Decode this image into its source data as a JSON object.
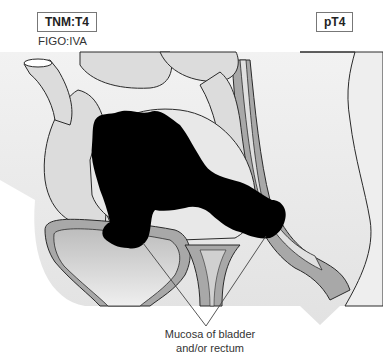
{
  "labels": {
    "tnm_stage": "TNM:T4",
    "figo_stage": "FIGO:IVA",
    "pathologic_stage": "pT4"
  },
  "callout": {
    "line1": "Mucosa of bladder",
    "line2": "and/or rectum"
  },
  "colors": {
    "tumor": "#000000",
    "tissue_fill": "#d9d9d9",
    "background_field": "#ececec",
    "wall_layer": "#a8a8a8",
    "outline": "#2a2a2a"
  }
}
